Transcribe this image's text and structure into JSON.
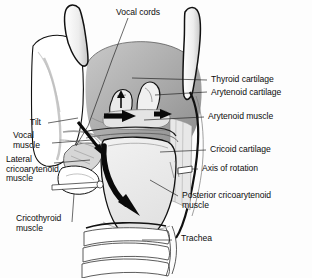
{
  "figure": {
    "background_color": "#fdfdfd",
    "ink_color": "#0d0d0d",
    "shade_dark": "#8e8e8e",
    "shade_mid": "#b5b5b5",
    "shade_light": "#dcdcdc",
    "shade_pale": "#efefef"
  },
  "labels": {
    "vocal_cords": "Vocal cords",
    "thyroid_cartilage": "Thyroid cartilage",
    "arytenoid_cartilage": "Arytenoid cartilage",
    "arytenoid_muscle": "Arytenoid muscle",
    "cricoid_cartilage": "Cricoid cartilage",
    "axis_of_rotation": "Axis of rotation",
    "posterior_cricoarytenoid_muscle": "Posterior cricoarytenoid\nmuscle",
    "trachea": "Trachea",
    "tilt": "Tilt",
    "vocal_muscle": "Vocal\nmuscle",
    "lateral_cricoarytenoid_muscle": "Lateral\ncricoarytenoid\nmuscle",
    "cricothyroid_muscle": "Cricothyroid\nmuscle"
  },
  "structures": [
    {
      "name": "superior-horn-left",
      "kind": "cartilage"
    },
    {
      "name": "superior-horn-right",
      "kind": "cartilage"
    },
    {
      "name": "thyroid-lamina",
      "kind": "cartilage"
    },
    {
      "name": "arytenoid-cartilage-left",
      "kind": "cartilage"
    },
    {
      "name": "arytenoid-cartilage-right",
      "kind": "cartilage"
    },
    {
      "name": "cricoid-cartilage",
      "kind": "cartilage"
    },
    {
      "name": "trachea-ring-1",
      "kind": "cartilage"
    },
    {
      "name": "trachea-ring-2",
      "kind": "cartilage"
    },
    {
      "name": "trachea-ring-3",
      "kind": "cartilage"
    }
  ],
  "arrows": [
    {
      "name": "arrow-arytenoid-left",
      "style": "straight",
      "direction": "right"
    },
    {
      "name": "arrow-arytenoid-right",
      "style": "straight",
      "direction": "right"
    },
    {
      "name": "arrow-rotation",
      "style": "curved",
      "direction": "down-right"
    },
    {
      "name": "arrow-tilt",
      "style": "straight",
      "direction": "down-right"
    }
  ]
}
